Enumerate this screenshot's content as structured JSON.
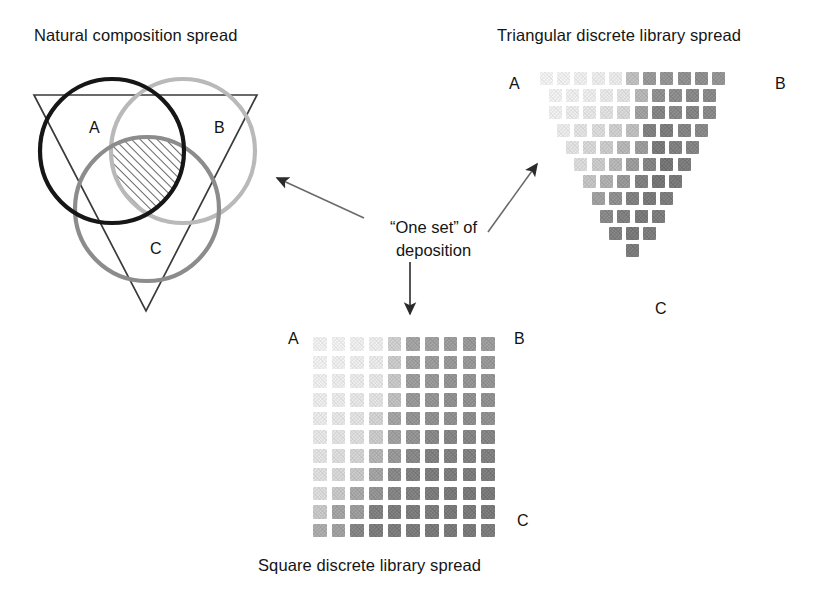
{
  "figure": {
    "kind": "combinatorial-library-diagram",
    "background": "#ffffff"
  },
  "venn": {
    "title": "Natural composition spread",
    "labels": {
      "a": "A",
      "b": "B",
      "c": "C"
    },
    "colors": {
      "circle_a": "#161616",
      "circle_b": "#b9b9b9",
      "circle_c": "#8c8c8c",
      "triangle": "#3a3a3a",
      "hatch": "#4a4a4a"
    },
    "circles": [
      {
        "name": "A",
        "cx": 112,
        "cy": 151,
        "r": 72,
        "stroke": "#161616",
        "width": 4.2
      },
      {
        "name": "B",
        "cx": 183,
        "cy": 151,
        "r": 72,
        "stroke": "#b9b9b9",
        "width": 4.2
      },
      {
        "name": "C",
        "cx": 147,
        "cy": 209,
        "r": 72,
        "stroke": "#8c8c8c",
        "width": 4.2
      }
    ],
    "triangle": {
      "x1": 34,
      "y1": 95,
      "x2": 257,
      "y2": 95,
      "x3": 146,
      "y3": 311
    },
    "hatched_region_note": "triple-overlap of A, B and C is hatched with 45-degree lines"
  },
  "center": {
    "caption_line1": "“One set” of",
    "caption_line2": "deposition"
  },
  "arrows": [
    {
      "name": "arrow-to-venn",
      "from_x": 364,
      "from_y": 218,
      "to_x": 272,
      "to_y": 176
    },
    {
      "name": "arrow-to-triangular-spread",
      "from_x": 488,
      "from_y": 232,
      "to_x": 540,
      "to_y": 162
    },
    {
      "name": "arrow-to-square-spread",
      "from_x": 410,
      "from_y": 262,
      "to_x": 410,
      "to_y": 318
    }
  ],
  "triangular_spread": {
    "title": "Triangular discrete library spread",
    "labels": {
      "a": "A",
      "b": "B",
      "c": "C"
    },
    "origin": {
      "x": 540,
      "y": 72
    },
    "cell": {
      "size": 13,
      "gap": 4.2
    },
    "rows": 11,
    "top_row_count": 11,
    "chart_data": {
      "type": "heatmap",
      "title": "Triangular discrete library spread",
      "corner_labels": [
        "A",
        "B",
        "C"
      ],
      "description": "Inverted triangular grid; each row loses one cell toward the C vertex. Cell darkness encodes composition intensity, increasing toward B and C.",
      "intensity_scale": [
        0,
        1
      ],
      "rows": [
        [
          0.04,
          0.05,
          0.06,
          0.07,
          0.08,
          0.3,
          0.5,
          0.52,
          0.54,
          0.55,
          0.52
        ],
        [
          0.05,
          0.06,
          0.07,
          0.09,
          0.12,
          0.34,
          0.54,
          0.56,
          0.58,
          0.58
        ],
        [
          0.06,
          0.08,
          0.1,
          0.13,
          0.18,
          0.46,
          0.6,
          0.58,
          0.6,
          0.58
        ],
        [
          0.08,
          0.12,
          0.16,
          0.22,
          0.3,
          0.62,
          0.64,
          0.6,
          0.58
        ],
        [
          0.12,
          0.18,
          0.24,
          0.34,
          0.48,
          0.66,
          0.62,
          0.6
        ],
        [
          0.16,
          0.24,
          0.34,
          0.48,
          0.6,
          0.68,
          0.64
        ],
        [
          0.28,
          0.38,
          0.5,
          0.62,
          0.68,
          0.66
        ],
        [
          0.46,
          0.54,
          0.62,
          0.66,
          0.64
        ],
        [
          0.58,
          0.62,
          0.66,
          0.64
        ],
        [
          0.62,
          0.66,
          0.64
        ],
        [
          0.65
        ]
      ]
    }
  },
  "square_spread": {
    "title": "Square discrete library spread",
    "labels": {
      "a": "A",
      "b": "B",
      "c": "C"
    },
    "origin": {
      "x": 313,
      "y": 337
    },
    "cell": {
      "size": 13.5,
      "gap": 5.2
    },
    "rows": 11,
    "cols": 10,
    "chart_data": {
      "type": "heatmap",
      "title": "Square discrete library spread",
      "corner_labels": [
        "A",
        "B",
        "C"
      ],
      "description": "10 x 11 grid of deposited library cells; darkness increases toward the bottom-right (B to C side).",
      "intensity_scale": [
        0,
        1
      ],
      "rows": [
        [
          0.05,
          0.05,
          0.06,
          0.07,
          0.22,
          0.44,
          0.46,
          0.48,
          0.5,
          0.48
        ],
        [
          0.05,
          0.06,
          0.07,
          0.08,
          0.24,
          0.46,
          0.48,
          0.5,
          0.5,
          0.5
        ],
        [
          0.06,
          0.07,
          0.08,
          0.1,
          0.26,
          0.48,
          0.5,
          0.52,
          0.52,
          0.52
        ],
        [
          0.07,
          0.08,
          0.1,
          0.12,
          0.3,
          0.5,
          0.52,
          0.54,
          0.54,
          0.54
        ],
        [
          0.08,
          0.1,
          0.12,
          0.2,
          0.44,
          0.52,
          0.54,
          0.54,
          0.56,
          0.54
        ],
        [
          0.1,
          0.12,
          0.15,
          0.24,
          0.46,
          0.52,
          0.58,
          0.6,
          0.6,
          0.6
        ],
        [
          0.12,
          0.15,
          0.2,
          0.36,
          0.5,
          0.58,
          0.62,
          0.62,
          0.62,
          0.62
        ],
        [
          0.14,
          0.18,
          0.26,
          0.44,
          0.58,
          0.62,
          0.64,
          0.64,
          0.64,
          0.64
        ],
        [
          0.16,
          0.26,
          0.42,
          0.52,
          0.6,
          0.62,
          0.64,
          0.66,
          0.66,
          0.66
        ],
        [
          0.26,
          0.44,
          0.48,
          0.62,
          0.64,
          0.64,
          0.64,
          0.66,
          0.66,
          0.66
        ],
        [
          0.4,
          0.46,
          0.6,
          0.64,
          0.64,
          0.64,
          0.66,
          0.66,
          0.66,
          0.64
        ]
      ]
    }
  }
}
